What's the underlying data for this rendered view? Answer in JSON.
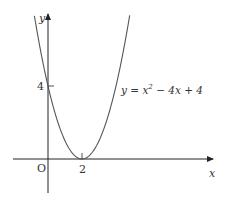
{
  "chart_data": {
    "type": "line",
    "title": "",
    "equation": "y = x² − 4x + 4",
    "function": {
      "a": 1,
      "b": -4,
      "c": 4
    },
    "xlabel": "x",
    "ylabel": "y",
    "origin_label": "O",
    "annotations": [
      {
        "text": "4",
        "at": {
          "x": 0,
          "y": 4
        },
        "note": "y-intercept tick"
      },
      {
        "text": "2",
        "at": {
          "x": 2,
          "y": 0
        },
        "note": "vertex / x-intercept tick"
      }
    ],
    "key_points": [
      {
        "x": 0,
        "y": 4
      },
      {
        "x": 2,
        "y": 0
      }
    ],
    "x": [
      -0.8,
      0,
      1,
      2,
      3,
      4,
      4.9
    ],
    "y": [
      7.84,
      4,
      1,
      0,
      1,
      4,
      8.41
    ],
    "xlim": [
      -2,
      7.7
    ],
    "ylim": [
      -2,
      8.5
    ],
    "grid": false,
    "legend": "none"
  },
  "labels": {
    "y_axis": "y",
    "x_axis": "x",
    "origin": "O",
    "tick_y4": "4",
    "tick_x2": "2",
    "eq_prefix": "y = x",
    "eq_exp": "2",
    "eq_suffix": " − 4x + 4"
  },
  "colors": {
    "axis": "#222222",
    "curve": "#555555",
    "text": "#333333"
  }
}
